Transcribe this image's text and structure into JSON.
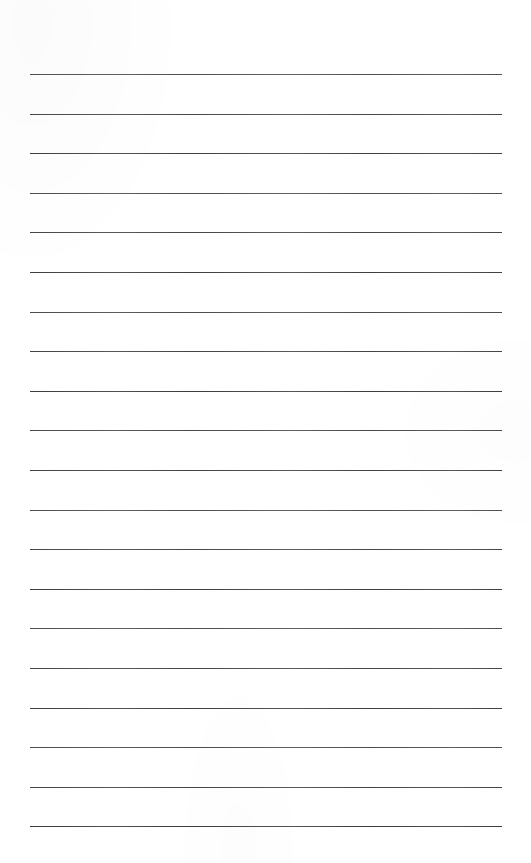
{
  "document": {
    "kind": "lined-paper",
    "title": "Lined Paper",
    "description": "Blank ruled writing paper with evenly spaced horizontal rules and no text content",
    "page": {
      "width": 531,
      "height": 863,
      "background_color": "#ffffff"
    },
    "rules": {
      "count": 20,
      "color": "#3c3c3c",
      "thickness_px": 1.6,
      "left_x": 30,
      "right_x": 502,
      "first_y": 74,
      "spacing_y": 39.6,
      "positions_y": [
        74.0,
        113.6,
        153.2,
        192.8,
        232.4,
        272.0,
        311.6,
        351.2,
        390.8,
        430.4,
        470.0,
        509.6,
        549.2,
        588.8,
        628.4,
        668.0,
        707.6,
        747.2,
        786.8,
        826.4
      ]
    },
    "content": {
      "text_lines": [
        "",
        "",
        "",
        "",
        "",
        "",
        "",
        "",
        "",
        "",
        "",
        "",
        "",
        "",
        "",
        "",
        "",
        "",
        "",
        ""
      ]
    }
  }
}
